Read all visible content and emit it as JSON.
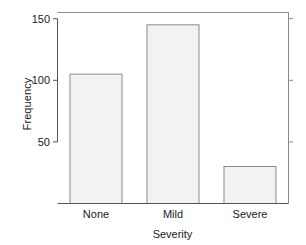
{
  "chart_data": {
    "type": "bar",
    "title": "",
    "subtitle": "",
    "xlabel": "Severity",
    "ylabel": "Frequency",
    "categories": [
      "None",
      "Mild",
      "Severe"
    ],
    "values": [
      105,
      145,
      30
    ],
    "series": [
      {
        "name": "Frequency",
        "values": [
          105,
          145,
          30
        ]
      }
    ],
    "ylim": [
      0,
      155
    ],
    "yticks": [
      50,
      100,
      150
    ],
    "ytick_labels": [
      "50",
      "100",
      "150"
    ],
    "xtick_labels": [
      "None",
      "Mild",
      "Severe"
    ],
    "grid": false,
    "legend": false,
    "legend_position": "none",
    "bar_fill_color": "#f2f2f2",
    "bar_border_color": "#8a8a8a",
    "axis_color": "#555555",
    "frame_color": "#8a8a8a",
    "background_color": "#ffffff",
    "annotations": []
  }
}
